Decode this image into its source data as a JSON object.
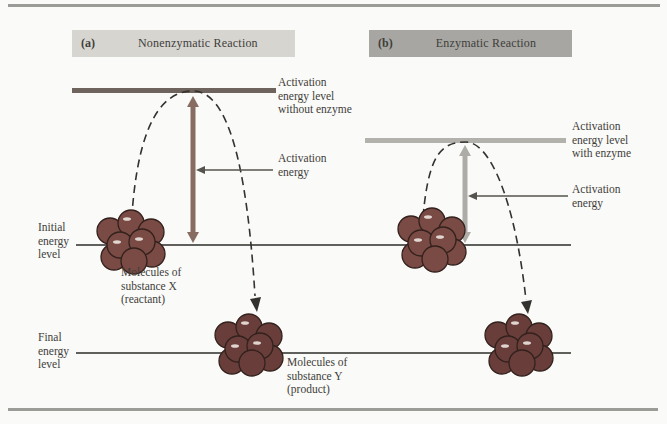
{
  "figure": {
    "panels": [
      {
        "id": "a",
        "tag": "(a)",
        "title": "Nonenzymatic Reaction",
        "activation_level_label": [
          "Activation",
          "energy level",
          "without enzyme"
        ],
        "activation_energy_label": [
          "Activation",
          "energy"
        ]
      },
      {
        "id": "b",
        "tag": "(b)",
        "title": "Enzymatic Reaction",
        "activation_level_label": [
          "Activation",
          "energy level",
          "with enzyme"
        ],
        "activation_energy_label": [
          "Activation",
          "energy"
        ]
      }
    ],
    "axis_labels": {
      "initial": [
        "Initial",
        "energy",
        "level"
      ],
      "final": [
        "Final",
        "energy",
        "level"
      ]
    },
    "molecule_labels": {
      "reactant": [
        "Molecules of",
        "substance X",
        "(reactant)"
      ],
      "product": [
        "Molecules of",
        "substance Y",
        "(product)"
      ]
    }
  },
  "colors": {
    "background": "#fafaf8",
    "rule_gray": "#9b9b98",
    "header_a_bg": "#d6d5d0",
    "header_b_bg": "#a7a6a2",
    "activation_bar_a": "#6f635d",
    "activation_arrow_a": "#876c61",
    "activation_bar_b": "#b3b1ab",
    "activation_arrow_b": "#aeaca6",
    "molecule_fill": "#7a4a44",
    "molecule_product_fill": "#693e3a",
    "molecule_outline": "#32211d",
    "line_black": "#2b2b28",
    "dash_line": "#33322f",
    "pointer_line": "#55534e",
    "text": "#3f3e3a"
  }
}
